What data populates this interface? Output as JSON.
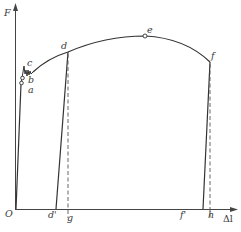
{
  "diagram": {
    "type": "stress-strain (force-elongation) curve",
    "axes": {
      "y_label": "F",
      "x_label": "Δl",
      "origin_label": "O"
    },
    "points": {
      "a": "a",
      "b": "b",
      "c": "c",
      "d": "d",
      "e": "e",
      "f": "f"
    },
    "x_marks": {
      "d_prime": "d'",
      "g": "g",
      "f_prime": "f'",
      "h": "h"
    },
    "colors": {
      "line": "#333333",
      "dashed": "#555555",
      "background": "#ffffff"
    }
  }
}
